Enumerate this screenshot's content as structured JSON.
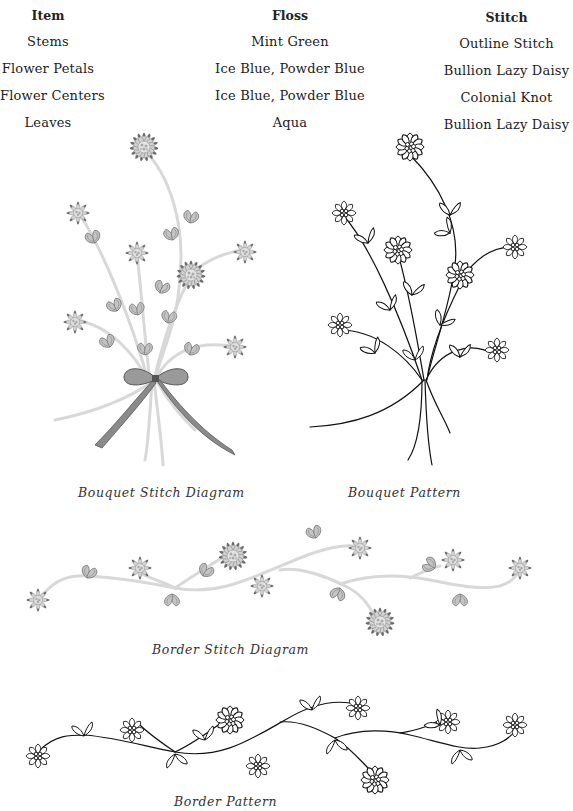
{
  "materials_table": {
    "headers": {
      "item": "Item",
      "floss": "Floss",
      "stitch": "Stitch"
    },
    "rows": [
      {
        "item": "Stems",
        "floss": "Mint Green",
        "stitch": "Outline Stitch"
      },
      {
        "item": "Flower Petals",
        "floss": "Ice Blue, Powder Blue",
        "stitch": "Bullion Lazy Daisy"
      },
      {
        "item": "Flower Centers",
        "floss": "Ice Blue, Powder Blue",
        "stitch": "Colonial Knot"
      },
      {
        "item": "Leaves",
        "floss": "Aqua",
        "stitch": "Bullion Lazy Daisy"
      }
    ]
  },
  "figures": {
    "bouquet_stitch": {
      "caption": "Bouquet Stitch Diagram"
    },
    "bouquet_pattern": {
      "caption": "Bouquet Pattern"
    },
    "border_stitch": {
      "caption": "Border Stitch Diagram"
    },
    "border_pattern": {
      "caption": "Border Pattern"
    }
  },
  "colors": {
    "stem_shaded": "#d6d6d6",
    "petal_fill": "#c8c8c8",
    "petal_tip": "#6e6e6e",
    "outline": "#111111",
    "ribbon": "#7a7a7a"
  }
}
